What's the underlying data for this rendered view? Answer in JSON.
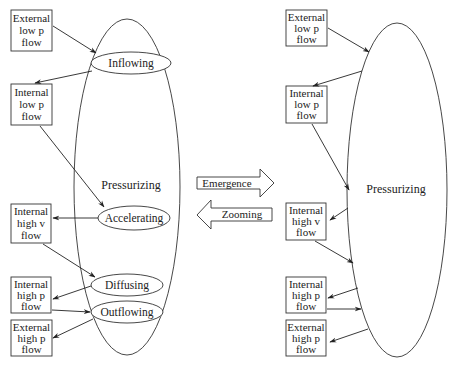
{
  "left_panel": {
    "container_label": "Pressurizing",
    "boxes": [
      {
        "id": "ext-low-p",
        "lines": [
          "External",
          "low p",
          "flow"
        ]
      },
      {
        "id": "int-low-p",
        "lines": [
          "Internal",
          "low p",
          "flow"
        ]
      },
      {
        "id": "int-high-v",
        "lines": [
          "Internal",
          "high v",
          "flow"
        ]
      },
      {
        "id": "int-high-p",
        "lines": [
          "Internal",
          "high p",
          "flow"
        ]
      },
      {
        "id": "ext-high-p",
        "lines": [
          "External",
          "high p",
          "flow"
        ]
      }
    ],
    "processes": [
      {
        "id": "inflowing",
        "label": "Inflowing"
      },
      {
        "id": "accelerating",
        "label": "Accelerating"
      },
      {
        "id": "diffusing",
        "label": "Diffusing"
      },
      {
        "id": "outflowing",
        "label": "Outflowing"
      }
    ],
    "arrows": [
      {
        "from": "External low p flow",
        "to": "Inflowing"
      },
      {
        "from": "Inflowing",
        "to": "Internal low p flow"
      },
      {
        "from": "Internal low p flow",
        "to": "Accelerating"
      },
      {
        "from": "Accelerating",
        "to": "Internal high v flow"
      },
      {
        "from": "Internal high v flow",
        "to": "Diffusing"
      },
      {
        "from": "Diffusing",
        "to": "Internal high p flow"
      },
      {
        "from": "Internal high p flow",
        "to": "Outflowing"
      },
      {
        "from": "Outflowing",
        "to": "External high p flow"
      }
    ]
  },
  "middle": {
    "emergence_label": "Emergence",
    "zooming_label": "Zooming"
  },
  "right_panel": {
    "container_label": "Pressurizing",
    "boxes": [
      {
        "id": "ext-low-p",
        "lines": [
          "External",
          "low p",
          "flow"
        ]
      },
      {
        "id": "int-low-p",
        "lines": [
          "Internal",
          "low p",
          "flow"
        ]
      },
      {
        "id": "int-high-v",
        "lines": [
          "Internal",
          "high v",
          "flow"
        ]
      },
      {
        "id": "int-high-p",
        "lines": [
          "Internal",
          "high p",
          "flow"
        ]
      },
      {
        "id": "ext-high-p",
        "lines": [
          "External",
          "high p",
          "flow"
        ]
      }
    ]
  }
}
